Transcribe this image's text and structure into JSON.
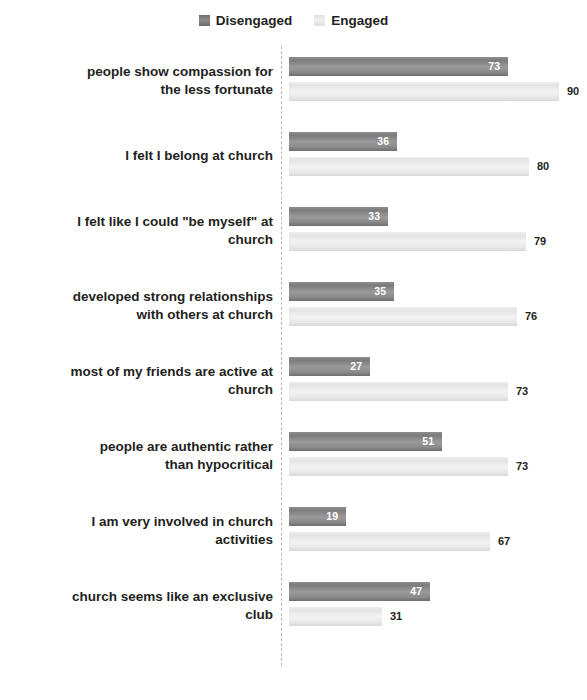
{
  "chart_data": {
    "type": "bar",
    "orientation": "horizontal",
    "title": "",
    "subtitle": "",
    "xlabel": "",
    "ylabel": "",
    "xlim": [
      0,
      100
    ],
    "grid": false,
    "legend_position": "top-center",
    "legend": [
      "Disengaged",
      "Engaged"
    ],
    "categories": [
      "people show compassion for the less fortunate",
      "I felt I belong at church",
      "I felt like I could \"be myself\" at church",
      "developed strong relationships with others at church",
      "most of my friends are active at church",
      "people are authentic rather than hypocritical",
      "I am very involved in church activities",
      "church seems like an exclusive club"
    ],
    "series": [
      {
        "name": "Disengaged",
        "color": "#8a8a8a",
        "values": [
          73,
          36,
          33,
          35,
          27,
          51,
          19,
          47
        ]
      },
      {
        "name": "Engaged",
        "color": "#e8e8e8",
        "values": [
          90,
          80,
          79,
          76,
          73,
          73,
          67,
          31
        ]
      }
    ]
  },
  "legend": {
    "items": [
      {
        "label": "Disengaged",
        "swatch": "dark-gray-swatch-icon"
      },
      {
        "label": "Engaged",
        "swatch": "light-gray-swatch-icon"
      }
    ]
  },
  "rows": [
    {
      "label_line1": "people show compassion for",
      "label_line2": "the less fortunate",
      "disengaged": "73",
      "engaged": "90"
    },
    {
      "label_line1": "I felt I belong at church",
      "label_line2": "",
      "disengaged": "36",
      "engaged": "80"
    },
    {
      "label_line1": "I felt like I could \"be myself\" at",
      "label_line2": "church",
      "disengaged": "33",
      "engaged": "79"
    },
    {
      "label_line1": "developed strong relationships",
      "label_line2": "with others at church",
      "disengaged": "35",
      "engaged": "76"
    },
    {
      "label_line1": "most of my friends are active at",
      "label_line2": "church",
      "disengaged": "27",
      "engaged": "73"
    },
    {
      "label_line1": "people are authentic rather",
      "label_line2": "than hypocritical",
      "disengaged": "51",
      "engaged": "73"
    },
    {
      "label_line1": "I am very involved in church",
      "label_line2": "activities",
      "disengaged": "19",
      "engaged": "67"
    },
    {
      "label_line1": "church seems like an exclusive",
      "label_line2": "club",
      "disengaged": "47",
      "engaged": "31"
    }
  ]
}
